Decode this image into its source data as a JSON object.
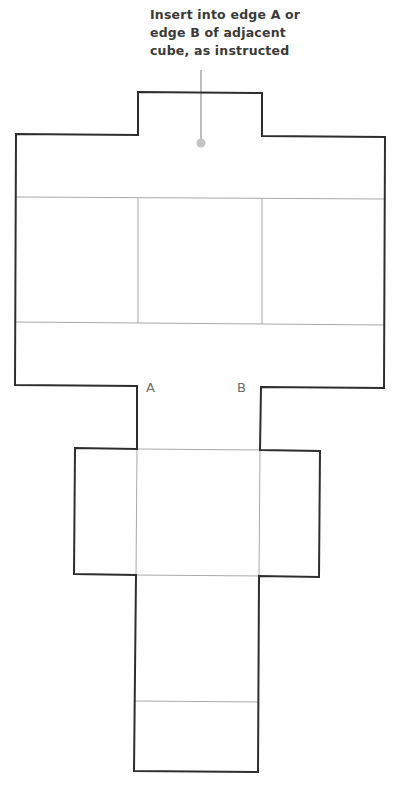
{
  "annotation": {
    "lines": [
      "Insert into edge A or",
      "edge B of adjacent",
      "cube, as instructed"
    ]
  },
  "edge_labels": {
    "a": "A",
    "b": "B"
  },
  "colors": {
    "outline": "#2e2e2e",
    "fold_line": "#a8a8a8",
    "leader": "#bdbdbd",
    "label_text": "#6a6a6a",
    "caption_text": "#3a3a3a"
  },
  "diagram": {
    "type": "cube-net-template",
    "panels": [
      "top-tab",
      "left-flap",
      "center-top-face",
      "right-flap",
      "center-middle-face",
      "side-flap-left",
      "center-lower-face",
      "side-flap-right",
      "bottom-face",
      "bottom-tab"
    ]
  }
}
